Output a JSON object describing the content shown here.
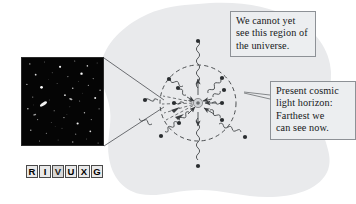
{
  "figure": {
    "background_color": "#ffffff",
    "blob_color": "#e9eaec",
    "ink_color": "#3a3d40"
  },
  "callouts": [
    {
      "id": "unseen-region",
      "lines": [
        "We cannot yet",
        "see this region of",
        "the universe."
      ],
      "box_color": "#eceef0",
      "border_color": "#8d9196"
    },
    {
      "id": "light-horizon",
      "lines": [
        "Present cosmic",
        "light horizon:",
        "Farthest we",
        "can see now."
      ],
      "box_color": "#eceef0",
      "border_color": "#8d9196"
    }
  ],
  "photo": {
    "name": "deep-field-image",
    "description": "Deep field telescope photograph: faint galaxies on black sky",
    "background_color": "#050505",
    "star_color": "#ffffff"
  },
  "wavelength_bar": {
    "name": "RIVUXG",
    "letters": [
      "R",
      "I",
      "V",
      "U",
      "X",
      "G"
    ],
    "highlighted": [
      "V"
    ],
    "cell_fill": "#e9e9e9",
    "cell_border": "#4a4a4a"
  },
  "diagram": {
    "horizon_circle": {
      "label": "present cosmic light horizon",
      "style": "dashed",
      "center_x": 198,
      "center_y": 103,
      "radius": 38
    },
    "observer": {
      "label": "observer at center",
      "x": 198,
      "y": 103
    },
    "photon_rays": [
      {
        "angle_deg": 270,
        "length": 60,
        "source_inside": false
      },
      {
        "angle_deg": 305,
        "length": 42,
        "source_inside": true
      },
      {
        "angle_deg": 335,
        "length": 60,
        "source_inside": false
      },
      {
        "angle_deg": 0,
        "length": 30,
        "source_inside": true
      },
      {
        "angle_deg": 25,
        "length": 44,
        "source_inside": true
      },
      {
        "angle_deg": 55,
        "length": 36,
        "source_inside": true
      },
      {
        "angle_deg": 90,
        "length": 60,
        "source_inside": false
      },
      {
        "angle_deg": 120,
        "length": 42,
        "source_inside": true
      },
      {
        "angle_deg": 150,
        "length": 58,
        "source_inside": false
      },
      {
        "angle_deg": 180,
        "length": 34,
        "source_inside": true
      },
      {
        "angle_deg": 210,
        "length": 34,
        "source_inside": true
      },
      {
        "angle_deg": 240,
        "length": 40,
        "source_inside": true
      }
    ],
    "zoom_cone": {
      "label": "magnified deep field region",
      "apex_x": 165,
      "apex_y": 103
    }
  }
}
